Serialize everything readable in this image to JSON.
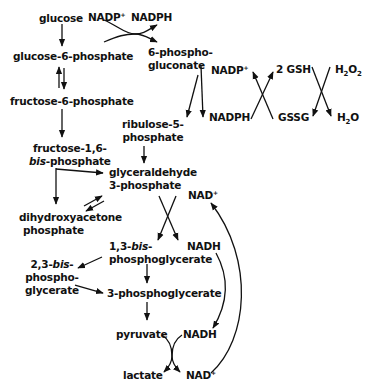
{
  "nodes": {
    "glucose": "glucose",
    "g6p": "glucose-6-phosphate",
    "f6p": "fructose-6-phosphate",
    "f16bp_1": "fructose-1,6-",
    "f16bp_2_italic": "bis",
    "f16bp_2_rest": "-phosphate",
    "pg6_1": "6-phospho-",
    "pg6_2": "gluconate",
    "ru5p_1": "ribulose-5-",
    "ru5p_2": "phosphate",
    "ga3p_1": "glyceraldehyde",
    "ga3p_2": "3-phosphate",
    "dhap_1": "dihydroxyacetone",
    "dhap_2": "phosphate",
    "bpg13_1a": "1,3-",
    "bpg13_1b_italic": "bis",
    "bpg13_1c": "-",
    "bpg13_2": "phosphoglycerate",
    "bpg23_1a": "2,3-",
    "bpg23_1b_italic": "bis",
    "bpg23_1c": "-",
    "bpg23_2": "phospho-",
    "bpg23_3": "glycerate",
    "pg3": "3-phosphoglycerate",
    "pyruvate": "pyruvate",
    "lactate": "lactate"
  },
  "cofactors": {
    "nadp_plus_1": "NADP",
    "nadph_1": "NADPH",
    "nadp_plus_2": "NADP",
    "nadph_2": "NADPH",
    "gsh": "2 GSH",
    "gssg": "GSSG",
    "h2o2_base": "H",
    "h2o2_mid": "O",
    "h2o_base": "H",
    "h2o_end": "O",
    "nad_plus_1": "NAD",
    "nadh_1": "NADH",
    "nadh_2": "NADH",
    "nad_plus_2": "NAD",
    "plus": "+",
    "sub2": "2"
  }
}
